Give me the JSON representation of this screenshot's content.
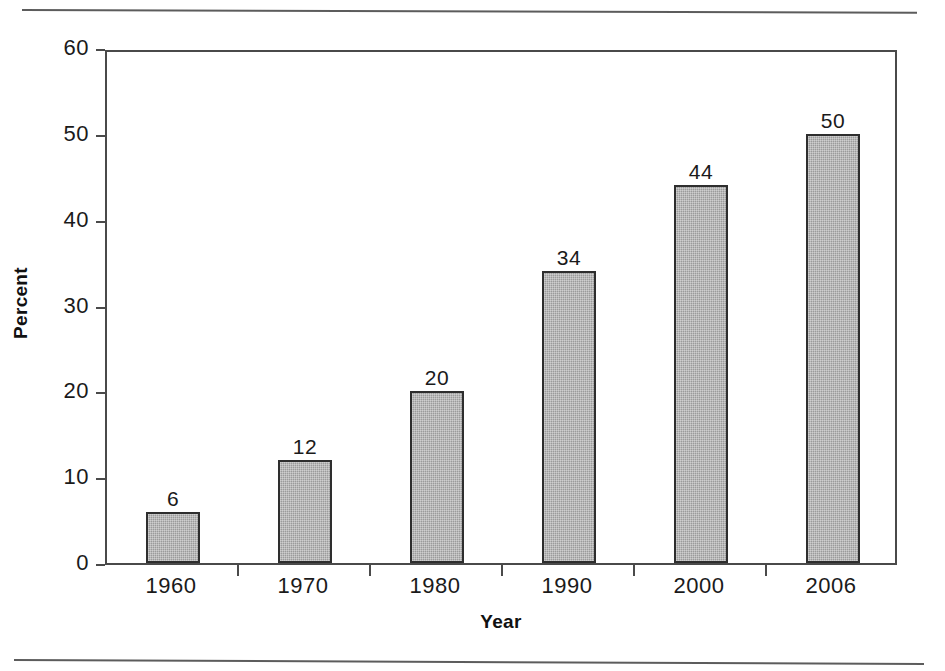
{
  "chart_data": {
    "type": "bar",
    "title": "",
    "subtitle": "",
    "categories": [
      "1960",
      "1970",
      "1980",
      "1990",
      "2000",
      "2006"
    ],
    "values": [
      6,
      12,
      20,
      34,
      44,
      50
    ],
    "data_labels": [
      "6",
      "12",
      "20",
      "34",
      "44",
      "50"
    ],
    "xlabel": "Year",
    "ylabel": "Percent",
    "ylim": [
      0,
      60
    ],
    "xlim_categories": 6,
    "y_ticks": [
      0,
      10,
      20,
      30,
      40,
      50,
      60
    ],
    "y_tick_labels": [
      "0",
      "10",
      "20",
      "30",
      "40",
      "50",
      "60"
    ],
    "grid": false,
    "legend": false,
    "legend_position": "none",
    "series": [
      {
        "name": "Percent",
        "values": [
          6,
          12,
          20,
          34,
          44,
          50
        ]
      }
    ],
    "colors": {
      "bar_fill": "#9b9b9b",
      "bar_border": "#2e2e2e",
      "axis_line": "#4a4a4a",
      "text": "#1a1a1a",
      "background": "#ffffff",
      "rule": "#5c5c5c"
    }
  },
  "figure": {
    "top_rule": "",
    "bottom_rule": ""
  }
}
